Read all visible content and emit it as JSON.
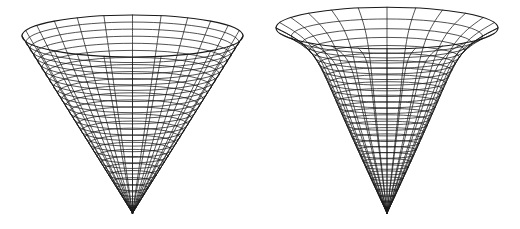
{
  "canvas": {
    "width": 520,
    "height": 229,
    "background": "#ffffff"
  },
  "style": {
    "stroke": "#1a1a1a",
    "ring_width": 0.75,
    "meridian_width": 0.75,
    "rim_width": 1.1
  },
  "figures": [
    {
      "id": "cone",
      "label": "cone-wireframe",
      "profile": "linear",
      "cx": 132.5,
      "rim_y": 36,
      "rim_rx": 110.5,
      "rim_ry": 21,
      "apex_y": 213,
      "rings": 28,
      "meridians": 24
    },
    {
      "id": "funnel",
      "label": "flared-funnel-wireframe",
      "profile": "flared",
      "cx": 387,
      "rim_y": 28,
      "rim_rx": 111,
      "rim_ry": 13,
      "apex_y": 213,
      "rings": 30,
      "meridians": 24,
      "flare_power": 2.6
    }
  ]
}
